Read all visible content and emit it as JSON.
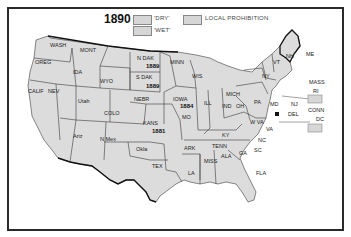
{
  "map": {
    "title": "1890",
    "legend": [
      {
        "label": "'DRY'",
        "color": "#d6d6d6"
      },
      {
        "label": "'WET'",
        "color": "#d6d6d6"
      },
      {
        "label": "LOCAL PROHIBITION",
        "color": "#d6d6d6"
      }
    ],
    "states": [
      {
        "abbr": "WASH"
      },
      {
        "abbr": "OREG"
      },
      {
        "abbr": "CALIF"
      },
      {
        "abbr": "NEV"
      },
      {
        "abbr": "IDA"
      },
      {
        "abbr": "MONT"
      },
      {
        "abbr": "WYO"
      },
      {
        "abbr": "Utah"
      },
      {
        "abbr": "COLO"
      },
      {
        "abbr": "Ariz"
      },
      {
        "abbr": "N Mex"
      },
      {
        "abbr": "N DAK",
        "year": "1889"
      },
      {
        "abbr": "S DAK",
        "year": "1889"
      },
      {
        "abbr": "NEBR"
      },
      {
        "abbr": "KANS",
        "year": "1881"
      },
      {
        "abbr": "Okla"
      },
      {
        "abbr": "TEX"
      },
      {
        "abbr": "MINN"
      },
      {
        "abbr": "IOWA",
        "year": "1884"
      },
      {
        "abbr": "MO"
      },
      {
        "abbr": "ARK"
      },
      {
        "abbr": "LA"
      },
      {
        "abbr": "WIS"
      },
      {
        "abbr": "ILL"
      },
      {
        "abbr": "MICH"
      },
      {
        "abbr": "IND"
      },
      {
        "abbr": "OH"
      },
      {
        "abbr": "KY"
      },
      {
        "abbr": "TENN"
      },
      {
        "abbr": "MISS"
      },
      {
        "abbr": "ALA"
      },
      {
        "abbr": "GA"
      },
      {
        "abbr": "FLA"
      },
      {
        "abbr": "SC"
      },
      {
        "abbr": "NC"
      },
      {
        "abbr": "VA"
      },
      {
        "abbr": "W VA"
      },
      {
        "abbr": "PA"
      },
      {
        "abbr": "NY"
      },
      {
        "abbr": "VT"
      },
      {
        "abbr": "NH"
      },
      {
        "abbr": "ME"
      },
      {
        "abbr": "MASS"
      },
      {
        "abbr": "RI"
      },
      {
        "abbr": "CONN"
      },
      {
        "abbr": "NJ"
      },
      {
        "abbr": "DEL"
      },
      {
        "abbr": "MD"
      },
      {
        "abbr": "DC"
      }
    ]
  }
}
